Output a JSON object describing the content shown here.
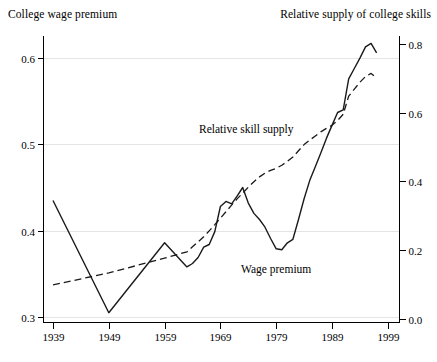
{
  "figure": {
    "left_axis_title": "College wage premium",
    "right_axis_title": "Relative supply of college skills",
    "annotations": {
      "supply_label": "Relative skill supply",
      "premium_label": "Wage premium"
    }
  },
  "chart_data": {
    "type": "line",
    "title": "",
    "x": [
      1939,
      1949,
      1959,
      1963,
      1964,
      1965,
      1966,
      1967,
      1968,
      1969,
      1970,
      1971,
      1972,
      1973,
      1974,
      1975,
      1976,
      1977,
      1978,
      1979,
      1980,
      1981,
      1982,
      1983,
      1984,
      1985,
      1986,
      1987,
      1988,
      1989,
      1990,
      1991,
      1992,
      1993,
      1994,
      1995,
      1996,
      1997
    ],
    "series": [
      {
        "name": "Wage premium",
        "axis": "left",
        "line_style": "solid",
        "color": "#1a1a1a",
        "values": [
          0.435,
          0.305,
          0.386,
          0.358,
          0.362,
          0.369,
          0.381,
          0.384,
          0.399,
          0.428,
          0.434,
          0.431,
          0.44,
          0.45,
          0.432,
          0.42,
          0.413,
          0.404,
          0.391,
          0.379,
          0.378,
          0.386,
          0.39,
          0.413,
          0.437,
          0.458,
          0.474,
          0.49,
          0.507,
          0.522,
          0.537,
          0.54,
          0.576,
          0.588,
          0.6,
          0.613,
          0.617,
          0.606
        ]
      },
      {
        "name": "Relative skill supply",
        "axis": "right",
        "line_style": "dashed",
        "color": "#1a1a1a",
        "values": [
          0.099,
          0.134,
          0.177,
          0.195,
          0.21,
          0.224,
          0.239,
          0.256,
          0.274,
          0.293,
          0.312,
          0.331,
          0.349,
          0.366,
          0.383,
          0.399,
          0.413,
          0.424,
          0.432,
          0.438,
          0.447,
          0.458,
          0.471,
          0.489,
          0.507,
          0.52,
          0.532,
          0.544,
          0.554,
          0.563,
          0.577,
          0.595,
          0.648,
          0.668,
          0.688,
          0.705,
          0.714,
          0.7
        ]
      }
    ],
    "x_axis": {
      "tick_labels": [
        "1939",
        "1949",
        "1959",
        "1969",
        "1979",
        "1989",
        "1999"
      ],
      "tick_values": [
        1939,
        1949,
        1959,
        1969,
        1979,
        1989,
        1999
      ],
      "range": [
        1937.2,
        2001
      ]
    },
    "left_axis": {
      "title": "College wage premium",
      "tick_labels": [
        "0.3",
        "0.4",
        "0.5",
        "0.6"
      ],
      "tick_values": [
        0.3,
        0.4,
        0.5,
        0.6
      ],
      "range": [
        0.294,
        0.626
      ]
    },
    "right_axis": {
      "title": "Relative supply of college skills",
      "tick_labels": [
        "0.0",
        "0.2",
        "0.4",
        "0.6",
        "0.8"
      ],
      "tick_values": [
        0.0,
        0.2,
        0.4,
        0.6,
        0.8
      ],
      "range": [
        0.0,
        0.83
      ]
    },
    "grid": {
      "horizontal_on_left_ticks": true,
      "color": "#e4e4e4"
    },
    "legend": "inline-labels",
    "annotations": [
      {
        "text": "Relative skill supply",
        "series": "Relative skill supply"
      },
      {
        "text": "Wage premium",
        "series": "Wage premium"
      }
    ]
  }
}
